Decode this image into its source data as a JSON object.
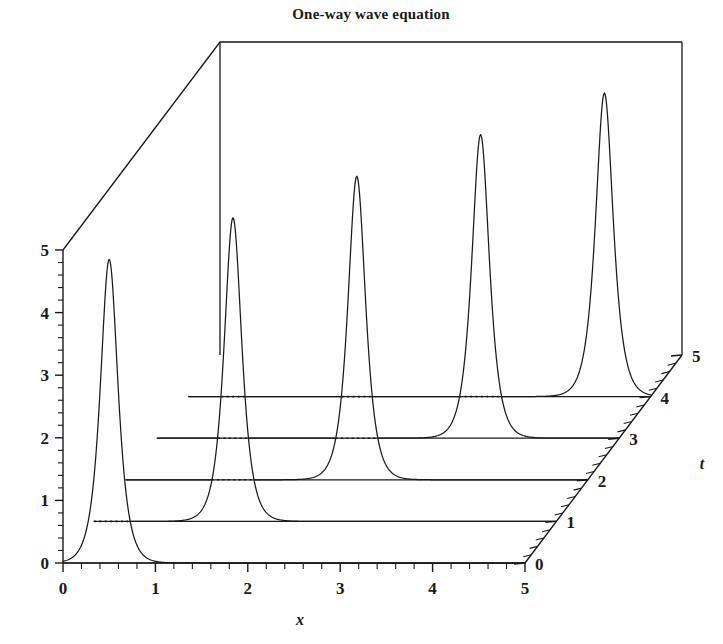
{
  "chart_data": {
    "type": "line",
    "title": "One-way wave equation",
    "subtitle": "",
    "projection": "3d-waterfall",
    "xlabel": "x",
    "ylabel": "t",
    "zlabel": "",
    "xlim": [
      0,
      5
    ],
    "ylim": [
      0,
      5
    ],
    "zlim": [
      0,
      5
    ],
    "x_ticks": [
      "0",
      "1",
      "2",
      "3",
      "4",
      "5"
    ],
    "t_ticks": [
      "0",
      "1",
      "2",
      "3",
      "4",
      "5"
    ],
    "z_ticks": [
      "0",
      "1",
      "2",
      "3",
      "4",
      "5"
    ],
    "x_minor_per_major": 5,
    "t_minor_per_major": 5,
    "z_minor_per_major": 5,
    "grid": false,
    "legend": null,
    "annotations": [],
    "series": [
      {
        "name": "t = 0",
        "t": 0,
        "peak_x": 0.5,
        "peak_z": 4.85,
        "width": 0.085,
        "baseline_z": 0
      },
      {
        "name": "t = 1",
        "t": 1,
        "peak_x": 1.5,
        "peak_z": 4.85,
        "width": 0.085,
        "baseline_z": 0
      },
      {
        "name": "t = 2",
        "t": 2,
        "peak_x": 2.5,
        "peak_z": 4.85,
        "width": 0.085,
        "baseline_z": 0
      },
      {
        "name": "t = 3",
        "t": 3,
        "peak_x": 3.5,
        "peak_z": 4.85,
        "width": 0.085,
        "baseline_z": 0
      },
      {
        "name": "t = 4",
        "t": 4,
        "peak_x": 4.5,
        "peak_z": 4.85,
        "width": 0.085,
        "baseline_z": 0
      }
    ]
  },
  "style": {
    "line_color": "#1a1a1a",
    "background": "#ffffff"
  },
  "geometry": {
    "origin_px": [
      63,
      563
    ],
    "x_unit_px": 92.4,
    "z_unit_px": 62.6,
    "t_unit_px": [
      31.4,
      -41.6
    ]
  }
}
